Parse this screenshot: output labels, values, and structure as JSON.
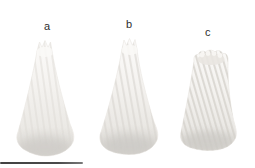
{
  "figure": {
    "panels": [
      {
        "label": "a"
      },
      {
        "label": "b"
      },
      {
        "label": "c"
      }
    ],
    "colors": {
      "background": "#ffffff",
      "cone_highlight": "#fcfbfa",
      "cone_body": "#f2f0ed",
      "cone_shade": "#dedbd6",
      "cone_bottom_shadow": "#c7c5c1",
      "label_text": "#2e2e2e",
      "scale_bar": "#454545"
    }
  }
}
